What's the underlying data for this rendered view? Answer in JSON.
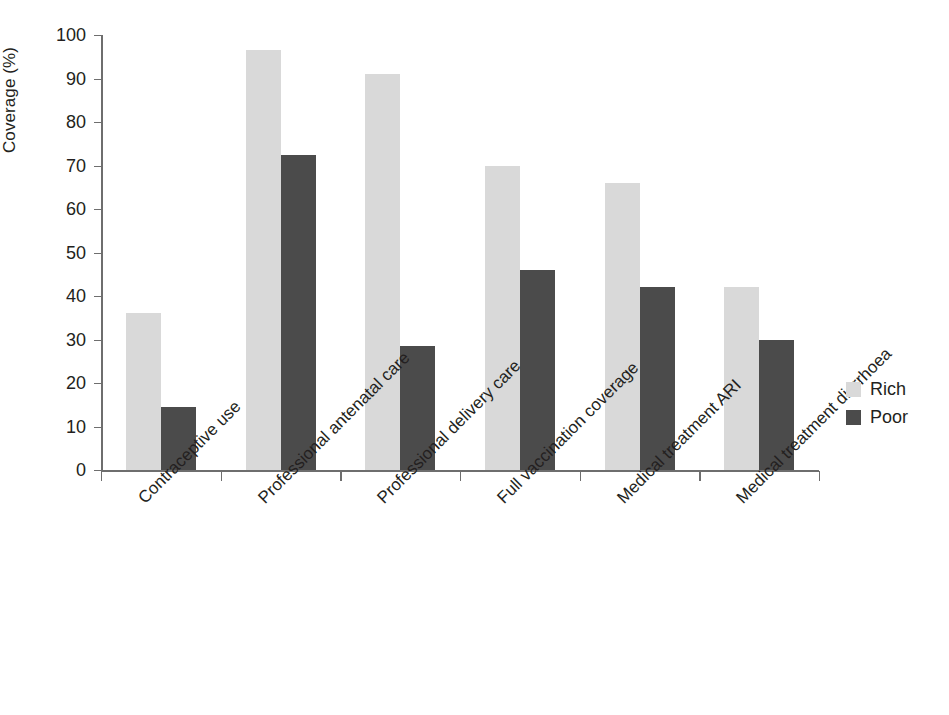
{
  "chart_data": {
    "type": "bar",
    "title": "",
    "subtitle": "",
    "xlabel": "",
    "ylabel": "Coverage (%)",
    "ylim": [
      0,
      100
    ],
    "ytick_interval": 10,
    "yticks": [
      0,
      10,
      20,
      30,
      40,
      50,
      60,
      70,
      80,
      90,
      100
    ],
    "grid": false,
    "legend_position": "right",
    "categories": [
      "Contraceptive use",
      "Professional antenatal care",
      "Professional delivery care",
      "Full vaccination coverage",
      "Medical treatment ARI",
      "Medical treatment diarrhoea"
    ],
    "series": [
      {
        "name": "Rich",
        "color": "#d9d9d9",
        "values": [
          36,
          96.5,
          91,
          70,
          66,
          42
        ]
      },
      {
        "name": "Poor",
        "color": "#4b4b4b",
        "values": [
          14.5,
          72.5,
          28.5,
          46,
          42,
          30
        ]
      }
    ],
    "annotations": []
  },
  "legend": {
    "items": [
      {
        "label": "Rich",
        "color": "#d9d9d9"
      },
      {
        "label": "Poor",
        "color": "#4b4b4b"
      }
    ]
  }
}
